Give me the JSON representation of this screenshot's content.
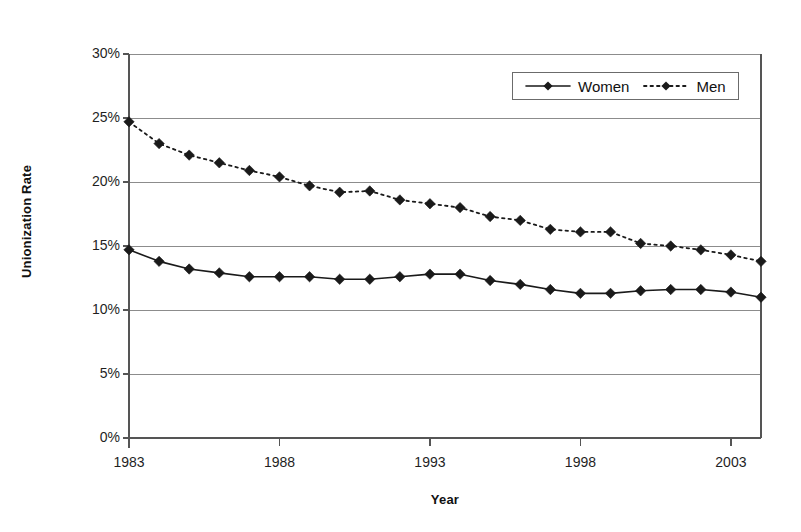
{
  "chart_data": {
    "type": "line",
    "title": "",
    "xlabel": "Year",
    "ylabel": "Unionization Rate",
    "xlim": [
      1983,
      2004
    ],
    "ylim": [
      0,
      30
    ],
    "ytick_labels": [
      "30%",
      "25%",
      "20%",
      "15%",
      "10%",
      "5%",
      "0%"
    ],
    "ytick_values": [
      30,
      25,
      20,
      15,
      10,
      5,
      0
    ],
    "xtick_labels": [
      "1983",
      "1988",
      "1993",
      "1998",
      "2003"
    ],
    "xtick_values": [
      1983,
      1988,
      1993,
      1998,
      2003
    ],
    "grid": "horizontal",
    "legend_position": "top-right",
    "x": [
      1983,
      1984,
      1985,
      1986,
      1987,
      1988,
      1989,
      1990,
      1991,
      1992,
      1993,
      1994,
      1995,
      1996,
      1997,
      1998,
      1999,
      2000,
      2001,
      2002,
      2003,
      2004
    ],
    "series": [
      {
        "name": "Women",
        "marker": "diamond",
        "linestyle": "solid",
        "color": "#1a1a1a",
        "values": [
          14.7,
          13.8,
          13.2,
          12.9,
          12.6,
          12.6,
          12.6,
          12.4,
          12.4,
          12.6,
          12.8,
          12.8,
          12.3,
          12.0,
          11.6,
          11.3,
          11.3,
          11.5,
          11.6,
          11.6,
          11.4,
          11.0
        ]
      },
      {
        "name": "Men",
        "marker": "diamond",
        "linestyle": "dotted",
        "color": "#1a1a1a",
        "values": [
          24.7,
          23.0,
          22.1,
          21.5,
          20.9,
          20.4,
          19.7,
          19.2,
          19.3,
          18.6,
          18.3,
          18.0,
          17.3,
          17.0,
          16.3,
          16.1,
          16.1,
          15.2,
          15.0,
          14.7,
          14.3,
          13.8
        ]
      }
    ]
  },
  "legend": {
    "entries": [
      {
        "label": "Women",
        "style": "solid-diamond"
      },
      {
        "label": "Men",
        "style": "dotted-diamond"
      }
    ]
  },
  "colors": {
    "series": "#1a1a1a",
    "gridline": "#8c8c8c",
    "axis": "#555555",
    "background": "#ffffff"
  }
}
